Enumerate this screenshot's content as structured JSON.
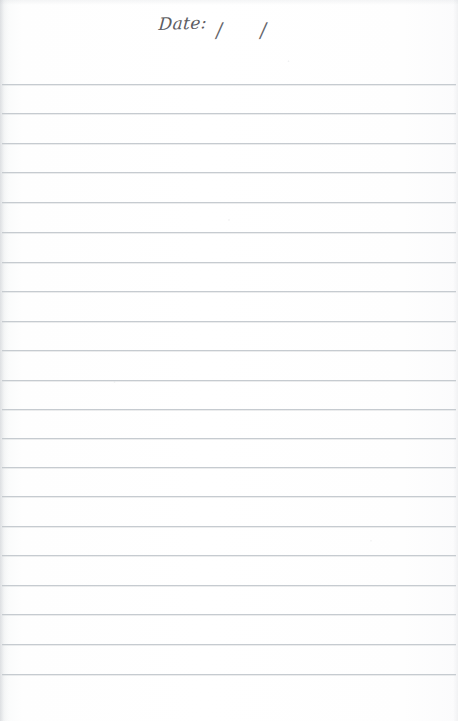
{
  "page": {
    "kind": "scanned-ruled-notebook-page",
    "width": 458,
    "height": 721,
    "background_color": "#fdfdfd",
    "is_blank": true,
    "written_content": ""
  },
  "header": {
    "date_label": "Date:",
    "separator_first": "/",
    "separator_second": "/",
    "date_value_day": "",
    "date_value_month": "",
    "date_value_year": ""
  },
  "ruling": {
    "line_color": "#c4c9ce",
    "line_count": 21,
    "first_line_y": 84,
    "line_spacing": 29.5,
    "left_inset": 2,
    "right_inset": 2,
    "lines_y": [
      84,
      113,
      143,
      172,
      202,
      232,
      262,
      291,
      321,
      350,
      380,
      409,
      438,
      467,
      496,
      526,
      555,
      585,
      614,
      644,
      674
    ]
  }
}
